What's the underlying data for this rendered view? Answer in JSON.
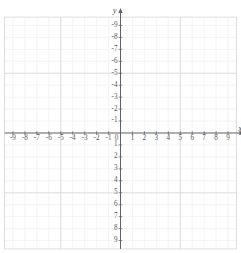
{
  "header": {
    "faint_text": ""
  },
  "chart_data": {
    "type": "scatter",
    "title": "",
    "subtitle": "",
    "xlabel": "x",
    "ylabel": "y",
    "xlim": [
      -9.7,
      9.7
    ],
    "ylim": [
      -9.7,
      9.7
    ],
    "grid": true,
    "minor_grid": true,
    "legend": null,
    "series": [],
    "x_ticks": [
      -9,
      -8,
      -7,
      -6,
      -5,
      -4,
      -3,
      -2,
      -1,
      0,
      1,
      2,
      3,
      4,
      5,
      6,
      7,
      8,
      9
    ],
    "y_ticks": [
      -9,
      -8,
      -7,
      -6,
      -5,
      -4,
      -3,
      -2,
      -1,
      1,
      2,
      3,
      4,
      5,
      6,
      7,
      8,
      9
    ],
    "x_tick_labels": [
      "-9",
      "-8",
      "-7",
      "-6",
      "-5",
      "-4",
      "-3",
      "-2",
      "-1",
      "0",
      "1",
      "2",
      "3",
      "4",
      "5",
      "6",
      "7",
      "8",
      "9"
    ],
    "y_tick_labels": [
      "9",
      "8",
      "7",
      "6",
      "5",
      "4",
      "3",
      "2",
      "1",
      "-1",
      "-2",
      "-3",
      "-4",
      "-5",
      "-6",
      "-7",
      "-8",
      "-9"
    ],
    "origin_label": "0",
    "axis_arrows": [
      "x-positive",
      "y-positive"
    ],
    "colors": {
      "axis": "#5f6368",
      "major_grid": "#dcdcdc",
      "minor_grid": "#efefef",
      "grid_border": "#d5d5d5",
      "tick_text": "#5a5a5a",
      "background": "#ffffff"
    }
  }
}
